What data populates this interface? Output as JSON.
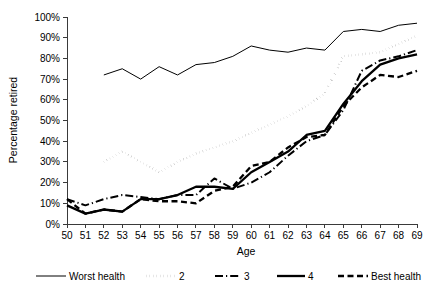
{
  "chart_data": {
    "type": "line",
    "title": "",
    "xlabel": "Age",
    "ylabel": "Percentage retired",
    "xlim": [
      50,
      69
    ],
    "ylim": [
      0,
      1.0
    ],
    "grid": false,
    "legend_position": "bottom",
    "x": [
      50,
      51,
      52,
      53,
      54,
      55,
      56,
      57,
      58,
      59,
      60,
      61,
      62,
      63,
      64,
      65,
      66,
      67,
      68,
      69
    ],
    "xtick_labels": [
      "50",
      "51",
      "52",
      "53",
      "54",
      "55",
      "56",
      "57",
      "58",
      "59",
      "60",
      "61",
      "62",
      "63",
      "64",
      "65",
      "66",
      "67",
      "68",
      "69"
    ],
    "ytick_labels": [
      "0%",
      "10%",
      "20%",
      "30%",
      "40%",
      "50%",
      "60%",
      "70%",
      "80%",
      "90%",
      "100%"
    ],
    "ytick_values": [
      0,
      10,
      20,
      30,
      40,
      50,
      60,
      70,
      80,
      90,
      100
    ],
    "series": [
      {
        "name": "Worst health",
        "style": "solid-thin",
        "x": [
          52,
          53,
          54,
          55,
          56,
          57,
          58,
          59,
          60,
          61,
          62,
          63,
          64,
          65,
          66,
          67,
          68,
          69
        ],
        "values": [
          72,
          75,
          70,
          76,
          72,
          77,
          78,
          81,
          86,
          84,
          83,
          85,
          84,
          93,
          94,
          93,
          96,
          97
        ]
      },
      {
        "name": "2",
        "style": "dotted",
        "x": [
          52,
          53,
          54,
          55,
          56,
          57,
          58,
          59,
          60,
          61,
          62,
          63,
          64,
          65,
          66,
          67,
          68,
          69
        ],
        "values": [
          30,
          35,
          30,
          25,
          30,
          34,
          37,
          40,
          44,
          48,
          52,
          57,
          63,
          81,
          82,
          83,
          87,
          91
        ]
      },
      {
        "name": "3",
        "style": "dash-dot",
        "x": [
          50,
          51,
          52,
          53,
          54,
          55,
          56,
          57,
          58,
          59,
          60,
          61,
          62,
          63,
          64,
          65,
          66,
          67,
          68,
          69
        ],
        "values": [
          12,
          9,
          12,
          14,
          13,
          12,
          14,
          14,
          22,
          17,
          20,
          25,
          33,
          40,
          43,
          55,
          74,
          79,
          81,
          84
        ]
      },
      {
        "name": "4",
        "style": "solid-thick",
        "x": [
          50,
          51,
          52,
          53,
          54,
          55,
          56,
          57,
          58,
          59,
          60,
          61,
          62,
          63,
          64,
          65,
          66,
          67,
          68,
          69
        ],
        "values": [
          9,
          5,
          7,
          6,
          12,
          12,
          14,
          18,
          18,
          17,
          25,
          30,
          35,
          43,
          45,
          58,
          69,
          77,
          80,
          82
        ]
      },
      {
        "name": "Best health",
        "style": "dashed",
        "x": [
          50,
          51,
          52,
          53,
          54,
          55,
          56,
          57,
          58,
          59,
          60,
          61,
          62,
          63,
          64,
          65,
          66,
          67,
          68,
          69
        ],
        "values": [
          12,
          5,
          7,
          6,
          12,
          11,
          11,
          10,
          16,
          18,
          28,
          30,
          37,
          42,
          43,
          57,
          66,
          72,
          71,
          74
        ]
      }
    ],
    "legend": [
      {
        "label": "Worst health",
        "style": "solid-thin"
      },
      {
        "label": "2",
        "style": "dotted"
      },
      {
        "label": "3",
        "style": "dash-dot"
      },
      {
        "label": "4",
        "style": "solid-thick"
      },
      {
        "label": "Best health",
        "style": "dashed"
      }
    ]
  }
}
